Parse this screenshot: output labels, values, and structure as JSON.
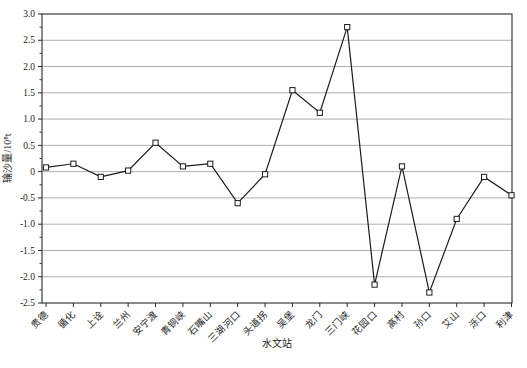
{
  "window": {
    "background": "#ffffff"
  },
  "chart_data": {
    "type": "line",
    "title": "",
    "xlabel": "水文站",
    "ylabel": "输沙量/10⁸t",
    "categories": [
      "贵德",
      "循化",
      "上诠",
      "兰州",
      "安宁渡",
      "青铜峡",
      "石嘴山",
      "三湖河口",
      "头道拐",
      "吴堡",
      "龙门",
      "三门峡",
      "花园口",
      "高村",
      "孙口",
      "艾山",
      "泺口",
      "利津"
    ],
    "values": [
      0.08,
      0.15,
      -0.1,
      0.02,
      0.55,
      0.1,
      0.15,
      -0.6,
      -0.05,
      1.55,
      1.12,
      2.75,
      -2.15,
      0.1,
      -2.3,
      -0.9,
      -0.1,
      -0.45
    ],
    "ylim": [
      -2.5,
      3.0
    ],
    "ytick_step": 0.5,
    "yticks": [
      "3.0",
      "2.5",
      "2.0",
      "1.5",
      "1.0",
      "0.5",
      "0",
      "-0.5",
      "-1.0",
      "-1.5",
      "-2.0",
      "-2.5"
    ],
    "minor_tick_step": 0.25,
    "legend": "none",
    "grid": "horizontal",
    "marker": "open-square",
    "colors": {
      "line": "#1c1c1c",
      "marker_fill": "#ffffff",
      "marker_edge": "#1c1c1c",
      "grid": "#9a9a9a",
      "border": "#2b2b2b",
      "text": "#1c1c1c"
    }
  }
}
